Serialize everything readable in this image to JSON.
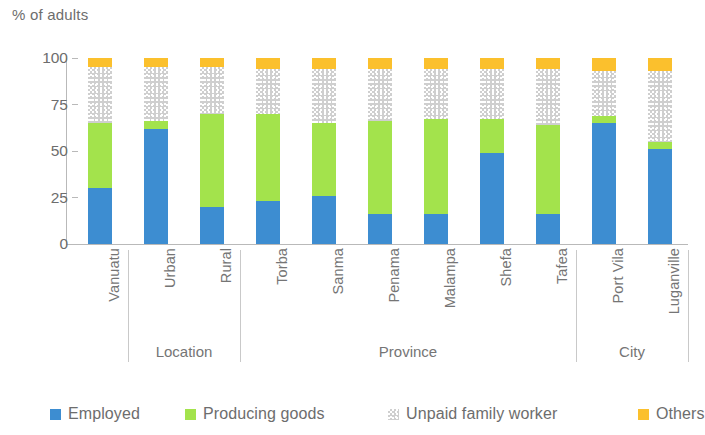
{
  "chart_data": {
    "type": "bar",
    "subtype": "stacked-bar-100",
    "title": "",
    "ylabel": "% of adults",
    "xlabel": "",
    "ylim": [
      0,
      100
    ],
    "yticks": [
      0,
      25,
      50,
      75,
      100
    ],
    "ytick_labels": [
      "0",
      "25",
      "50",
      "75",
      "100"
    ],
    "grid": false,
    "legend_position": "bottom",
    "categories": [
      "Vanuatu",
      "Urban",
      "Rural",
      "Torba",
      "Sanma",
      "Penama",
      "Malampa",
      "Shefa",
      "Tafea",
      "Port Vila",
      "Luganville"
    ],
    "groups": [
      {
        "label": "",
        "categories": [
          "Vanuatu"
        ]
      },
      {
        "label": "Location",
        "categories": [
          "Urban",
          "Rural"
        ]
      },
      {
        "label": "Province",
        "categories": [
          "Torba",
          "Sanma",
          "Penama",
          "Malampa",
          "Shefa",
          "Tafea"
        ]
      },
      {
        "label": "City",
        "categories": [
          "Port Vila",
          "Luganville"
        ]
      }
    ],
    "series": [
      {
        "name": "Employed",
        "color": "#3d8dd1",
        "values": [
          30,
          62,
          20,
          23,
          26,
          16,
          16,
          49,
          16,
          65,
          51
        ]
      },
      {
        "name": "Producing goods",
        "color": "#a3e34c",
        "values": [
          35,
          4,
          50,
          47,
          39,
          50,
          51,
          18,
          48,
          4,
          4
        ]
      },
      {
        "name": "Unpaid family worker",
        "color": "#cfcfcf",
        "values": [
          30,
          29,
          25,
          24,
          29,
          28,
          27,
          27,
          30,
          24,
          38
        ]
      },
      {
        "name": "Others",
        "color": "#fbc02d",
        "values": [
          5,
          5,
          5,
          6,
          6,
          6,
          6,
          6,
          6,
          7,
          7
        ]
      }
    ]
  }
}
